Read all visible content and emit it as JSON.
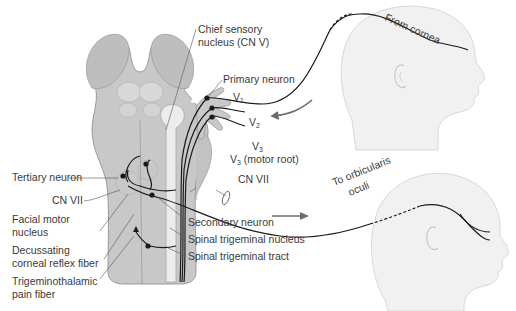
{
  "diagram": {
    "labels": {
      "chief_sensory_line1": "Chief sensory",
      "chief_sensory_line2": "nucleus (CN V)",
      "primary_neuron": "Primary neuron",
      "v1": "V",
      "v1_sub": "1",
      "v2": "V",
      "v2_sub": "2",
      "v3": "V",
      "v3_sub": "3",
      "v3_motor": "V",
      "v3_motor_sub": "3",
      "v3_motor_suffix": " (motor root)",
      "cn_vii_right": "CN VII",
      "tertiary_neuron": "Tertiary neuron",
      "cn_vii_left": "CN VII",
      "facial_motor_line1": "Facial motor",
      "facial_motor_line2": "nucleus",
      "decussating_line1": "Decussating",
      "decussating_line2": "corneal reflex fiber",
      "trigeminothalamic_line1": "Trigeminothalamic",
      "trigeminothalamic_line2": "pain fiber",
      "secondary_neuron": "Secondary neuron",
      "spinal_trigeminal_nucleus": "Spinal trigeminal nucleus",
      "spinal_trigeminal_tract": "Spinal trigeminal tract",
      "from_cornea": "From cornea",
      "to_orbicularis_line1": "To orbicularis",
      "to_orbicularis_line2": "oculi"
    },
    "colors": {
      "brainstem_fill": "#c8c8c8",
      "brainstem_stroke": "#9a9a9a",
      "nucleus_fill": "#ececec",
      "head_fill": "#f1f1f1",
      "nerve": "#1a1a1a",
      "arrow": "#6a6a6a",
      "text": "#3a3a3a"
    }
  }
}
